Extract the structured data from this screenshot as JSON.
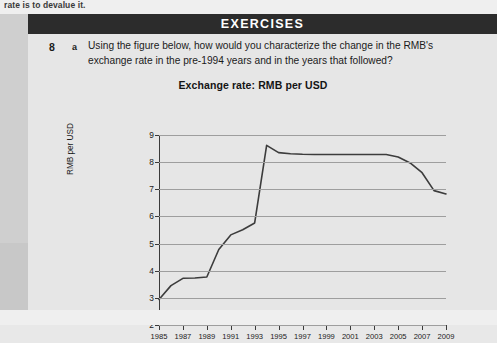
{
  "running_head": "rate is to devalue it.",
  "banner": {
    "title": "EXERCISES"
  },
  "exercise": {
    "number": "8",
    "part": "a",
    "prompt": "Using the figure below, how would you characterize the change in the RMB's exchange rate in the pre-1994 years and in the years that followed?"
  },
  "colors": {
    "banner_background": "#2c2c2c",
    "banner_text": "#ffffff",
    "page_background": "#e6e6e6",
    "margin_strip": "#cfcfcf",
    "series_line": "#3c3c3c",
    "gridline": "#9e9e9e",
    "axis": "#3a3a3a",
    "text": "#1b1b1b"
  },
  "chart_data": {
    "type": "line",
    "title": "Exchange rate: RMB per USD",
    "xlabel": "",
    "ylabel": "RMB per USD",
    "xlim": [
      1985,
      2009
    ],
    "ylim": [
      2,
      9
    ],
    "yticks": [
      2,
      3,
      4,
      5,
      6,
      7,
      8,
      9
    ],
    "xticks": [
      1985,
      1987,
      1989,
      1991,
      1993,
      1995,
      1997,
      1999,
      2001,
      2003,
      2005,
      2007,
      2009
    ],
    "grid": "horizontal",
    "legend": "none",
    "series": [
      {
        "name": "RMB per USD",
        "x": [
          1985,
          1986,
          1987,
          1988,
          1989,
          1990,
          1991,
          1992,
          1993,
          1994,
          1995,
          1996,
          1997,
          1998,
          1999,
          2000,
          2001,
          2002,
          2003,
          2004,
          2005,
          2006,
          2007,
          2008,
          2009
        ],
        "values": [
          2.94,
          3.45,
          3.72,
          3.73,
          3.77,
          4.78,
          5.32,
          5.51,
          5.76,
          8.62,
          8.35,
          8.31,
          8.29,
          8.28,
          8.28,
          8.28,
          8.28,
          8.28,
          8.28,
          8.28,
          8.19,
          7.97,
          7.61,
          6.95,
          6.83
        ]
      }
    ]
  }
}
